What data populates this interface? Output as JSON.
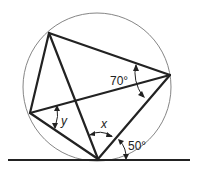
{
  "figure": {
    "type": "cyclic-quadrilateral-with-tangent",
    "circle": {
      "cx": 97,
      "cy": 87,
      "r": 74
    },
    "points": {
      "A": {
        "x": 49,
        "y": 33
      },
      "C": {
        "x": 170,
        "y": 75
      },
      "D": {
        "x": 30,
        "y": 113
      },
      "B": {
        "x": 98,
        "y": 159
      }
    },
    "tangent": {
      "x1": 8,
      "y1": 160,
      "x2": 190,
      "y2": 160
    },
    "labels": {
      "angle_c": "70°",
      "angle_y": "y",
      "angle_x": "x",
      "angle_tangent": "50°"
    }
  },
  "colors": {
    "stroke": "#222222",
    "circle": "#777777",
    "background": "#ffffff"
  }
}
